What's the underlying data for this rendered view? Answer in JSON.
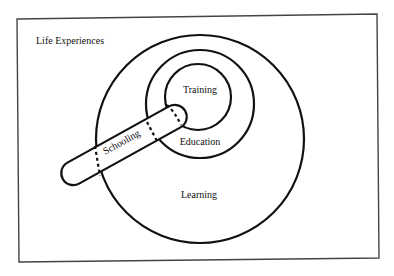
{
  "diagram": {
    "type": "nested-venn",
    "outer_label": "Life Experiences",
    "circles": [
      {
        "id": "learning",
        "label": "Learning",
        "cx": 200,
        "cy": 139,
        "r": 104
      },
      {
        "id": "education",
        "label": "Education",
        "cx": 200,
        "cy": 104,
        "r": 54
      },
      {
        "id": "training",
        "label": "Training",
        "cx": 198,
        "cy": 97,
        "r": 33
      }
    ],
    "capsule": {
      "id": "schooling",
      "label": "Schooling",
      "angle_deg": -29
    },
    "relationships": [
      "Training is contained within Education",
      "Education is contained within Learning",
      "Learning is contained within Life Experiences",
      "Schooling overlaps Learning, Education and Training and extends outside Learning"
    ],
    "colors": {
      "stroke": "#111111",
      "frame": "#444444",
      "background": "#ffffff"
    }
  }
}
